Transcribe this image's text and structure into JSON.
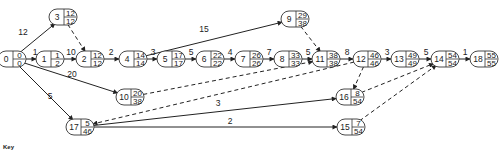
{
  "diagram": {
    "type": "activity-network",
    "nodes": [
      {
        "id": "0",
        "x": 12,
        "y": 59,
        "top": "0",
        "bottom": "0"
      },
      {
        "id": "1",
        "x": 50,
        "y": 59,
        "top": "1",
        "bottom": "2"
      },
      {
        "id": "2",
        "x": 90,
        "y": 59,
        "top": "12",
        "bottom": "12"
      },
      {
        "id": "3",
        "x": 63,
        "y": 17,
        "top": "12",
        "bottom": "12"
      },
      {
        "id": "4",
        "x": 133,
        "y": 59,
        "top": "14",
        "bottom": "14"
      },
      {
        "id": "5",
        "x": 171,
        "y": 59,
        "top": "17",
        "bottom": "17"
      },
      {
        "id": "6",
        "x": 210,
        "y": 59,
        "top": "22",
        "bottom": "22"
      },
      {
        "id": "7",
        "x": 249,
        "y": 59,
        "top": "26",
        "bottom": "26"
      },
      {
        "id": "8",
        "x": 288,
        "y": 59,
        "top": "33",
        "bottom": "33"
      },
      {
        "id": "9",
        "x": 295,
        "y": 19,
        "top": "29",
        "bottom": "38"
      },
      {
        "id": "10",
        "x": 130,
        "y": 97,
        "top": "20",
        "bottom": "38"
      },
      {
        "id": "11",
        "x": 326,
        "y": 59,
        "top": "38",
        "bottom": "38"
      },
      {
        "id": "12",
        "x": 367,
        "y": 59,
        "top": "46",
        "bottom": "46"
      },
      {
        "id": "13",
        "x": 405,
        "y": 59,
        "top": "49",
        "bottom": "49"
      },
      {
        "id": "14",
        "x": 445,
        "y": 59,
        "top": "54",
        "bottom": "54"
      },
      {
        "id": "15",
        "x": 351,
        "y": 127,
        "top": "7",
        "bottom": "54"
      },
      {
        "id": "16",
        "x": 350,
        "y": 97,
        "top": "8",
        "bottom": "54"
      },
      {
        "id": "17",
        "x": 80,
        "y": 127,
        "top": "5",
        "bottom": "46"
      },
      {
        "id": "18",
        "x": 484,
        "y": 59,
        "top": "55",
        "bottom": "55"
      }
    ],
    "edges": [
      {
        "from": "0",
        "to": "3",
        "label": "12",
        "style": "solid",
        "lx": 23,
        "ly": 35
      },
      {
        "from": "0",
        "to": "1",
        "label": "1",
        "style": "solid",
        "lx": 35,
        "ly": 55
      },
      {
        "from": "0",
        "to": "10",
        "label": "20",
        "style": "solid",
        "lx": 72,
        "ly": 77
      },
      {
        "from": "0",
        "to": "17",
        "label": "5",
        "style": "solid",
        "lx": 50,
        "ly": 99
      },
      {
        "from": "1",
        "to": "2",
        "label": "10",
        "style": "solid",
        "lx": 71,
        "ly": 55
      },
      {
        "from": "3",
        "to": "2",
        "label": "",
        "style": "dashed",
        "lx": 0,
        "ly": 0
      },
      {
        "from": "2",
        "to": "4",
        "label": "2",
        "style": "solid",
        "lx": 111,
        "ly": 55
      },
      {
        "from": "4",
        "to": "5",
        "label": "3",
        "style": "solid",
        "lx": 153,
        "ly": 55
      },
      {
        "from": "4",
        "to": "9",
        "label": "15",
        "style": "solid",
        "lx": 204,
        "ly": 32
      },
      {
        "from": "5",
        "to": "6",
        "label": "5",
        "style": "solid",
        "lx": 191,
        "ly": 55
      },
      {
        "from": "6",
        "to": "7",
        "label": "4",
        "style": "solid",
        "lx": 230,
        "ly": 55
      },
      {
        "from": "7",
        "to": "8",
        "label": "7",
        "style": "solid",
        "lx": 269,
        "ly": 55
      },
      {
        "from": "8",
        "to": "11",
        "label": "5",
        "style": "solid",
        "lx": 308,
        "ly": 55
      },
      {
        "from": "9",
        "to": "11",
        "label": "",
        "style": "dashed",
        "lx": 0,
        "ly": 0
      },
      {
        "from": "10",
        "to": "11",
        "label": "",
        "style": "dashed",
        "lx": 0,
        "ly": 0
      },
      {
        "from": "11",
        "to": "12",
        "label": "8",
        "style": "solid",
        "lx": 347,
        "ly": 55
      },
      {
        "from": "12",
        "to": "13",
        "label": "3",
        "style": "solid",
        "lx": 387,
        "ly": 55
      },
      {
        "from": "12",
        "to": "16",
        "label": "",
        "style": "dashed",
        "lx": 0,
        "ly": 0
      },
      {
        "from": "12",
        "to": "17",
        "label": "",
        "style": "dashed",
        "lx": 0,
        "ly": 0
      },
      {
        "from": "13",
        "to": "14",
        "label": "5",
        "style": "solid",
        "lx": 426,
        "ly": 55
      },
      {
        "from": "14",
        "to": "18",
        "label": "1",
        "style": "solid",
        "lx": 465,
        "ly": 55
      },
      {
        "from": "16",
        "to": "14",
        "label": "",
        "style": "dashed",
        "lx": 0,
        "ly": 0
      },
      {
        "from": "15",
        "to": "14",
        "label": "",
        "style": "dashed",
        "lx": 0,
        "ly": 0
      },
      {
        "from": "17",
        "to": "16",
        "label": "3",
        "style": "solid",
        "lx": 218,
        "ly": 106
      },
      {
        "from": "17",
        "to": "15",
        "label": "2",
        "style": "solid",
        "lx": 230,
        "ly": 124
      }
    ]
  },
  "key": {
    "label": "Key"
  }
}
